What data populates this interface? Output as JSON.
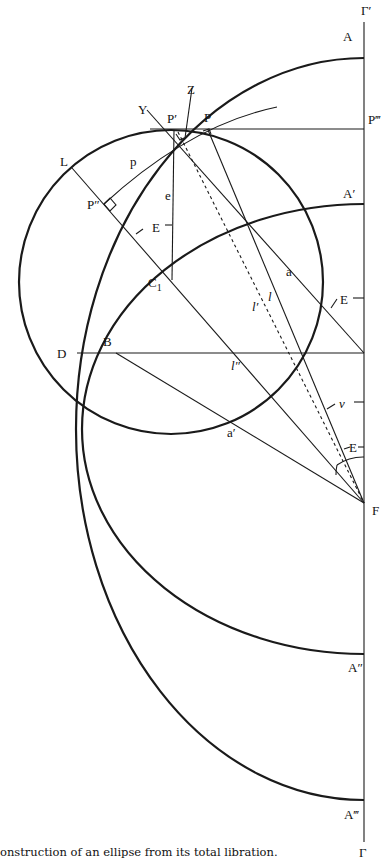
{
  "figure": {
    "caption": "onstruction of an ellipse from its total libration.",
    "labels": {
      "gamma_prime": "Γ′",
      "gamma": "Γ",
      "A": "A",
      "A_prime": "A′",
      "A_double": "A″",
      "A_triple": "A‴",
      "P": "P",
      "P_prime": "P′",
      "P_double": "P″",
      "P_triple": "P‴",
      "Y": "Y",
      "Z": "Z",
      "L": "L",
      "p": "p",
      "e": "e",
      "E_1": "E",
      "E_2": "E",
      "E_3": "E",
      "C1": "C",
      "C1_sub": "1",
      "a": "a",
      "a_prime": "a′",
      "l": "l",
      "l_prime": "l′",
      "l_double": "l″",
      "D": "D",
      "B": "B",
      "v": "v",
      "F": "F"
    }
  }
}
